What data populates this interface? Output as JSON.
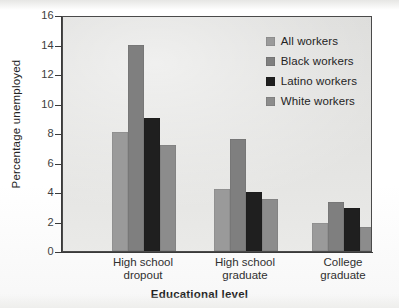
{
  "chart_data": {
    "type": "bar",
    "title": "",
    "xlabel": "Educational level",
    "ylabel": "Percentage unemployed",
    "categories": [
      "High school dropout",
      "High school graduate",
      "College graduate"
    ],
    "category_lines": [
      [
        "High school",
        "dropout"
      ],
      [
        "High school",
        "graduate"
      ],
      [
        "College",
        "graduate"
      ]
    ],
    "series": [
      {
        "name": "All workers",
        "color": "#9a9a9a",
        "values": [
          8.1,
          4.2,
          1.9
        ]
      },
      {
        "name": "Black workers",
        "color": "#7f7f7f",
        "values": [
          14.0,
          7.6,
          3.3
        ]
      },
      {
        "name": "Latino workers",
        "color": "#1f1f1f",
        "values": [
          9.0,
          4.0,
          2.9
        ]
      },
      {
        "name": "White workers",
        "color": "#8c8c8c",
        "values": [
          7.2,
          3.5,
          1.6
        ]
      }
    ],
    "ylim": [
      0,
      16
    ],
    "yticks": [
      0,
      2,
      4,
      6,
      8,
      10,
      12,
      14,
      16
    ],
    "ytick_labels": [
      "0",
      "2",
      "4",
      "6",
      "8",
      "10",
      "12",
      "14",
      "16"
    ],
    "grid": false,
    "legend_position": "top-right",
    "plot_background": "#dcdcda",
    "axis_color": "#3a3a3a"
  }
}
